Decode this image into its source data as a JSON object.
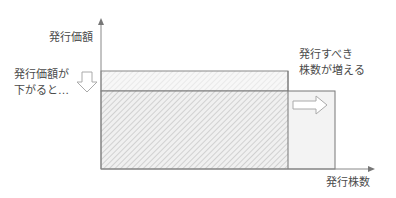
{
  "diagram": {
    "y_axis_label": "発行価額",
    "x_axis_label": "発行株数",
    "left_note": [
      "発行価額が",
      "下がると…"
    ],
    "right_note": [
      "発行すべき",
      "株数が増える"
    ],
    "down_arrow_icon": "down-arrow-outline",
    "right_arrow_icon": "right-arrow-outline",
    "colors": {
      "axis": "#888888",
      "outline": "#777777",
      "hatch": "#c8c8c8",
      "fill_light": "#f2f2f2",
      "fill_lighter": "#f6f6f6"
    }
  }
}
